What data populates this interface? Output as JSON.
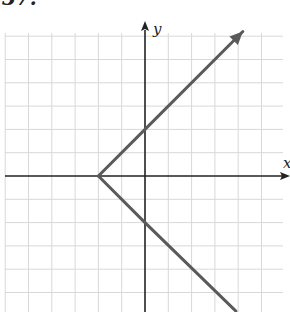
{
  "problem_number": "37.",
  "chart_data": {
    "type": "line",
    "title": "",
    "xlabel": "x",
    "ylabel": "y",
    "grid": true,
    "xlim": [
      -6.3,
      6.2
    ],
    "ylim": [
      -5.8,
      6.6
    ],
    "unit_px": 23.3,
    "origin_px": [
      145,
      176
    ],
    "series": [
      {
        "name": "upper-ray",
        "points": [
          [
            -2,
            0
          ],
          [
            0,
            2
          ],
          [
            4.2,
            6.2
          ]
        ],
        "arrow_end": true
      },
      {
        "name": "lower-ray",
        "points": [
          [
            -2,
            0
          ],
          [
            0,
            -2
          ],
          [
            3.9,
            -5.8
          ]
        ],
        "arrow_end": false
      }
    ],
    "annotations": [
      "vertex (-2, 0)",
      "y-intercepts (0, 2) and (0, -2)"
    ],
    "colors": {
      "curve": "#5a5a5a",
      "axis": "#222222",
      "grid": "#d8d8d8"
    }
  }
}
